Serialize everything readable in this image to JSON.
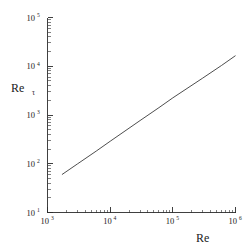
{
  "chart_data": {
    "type": "line",
    "title": "",
    "subtitle": "",
    "xlabel": "Re",
    "ylabel": "Re",
    "ylabel_subscript": "τ",
    "xscale": "log",
    "yscale": "log",
    "xlim": [
      1000,
      1000000
    ],
    "ylim": [
      10,
      100000
    ],
    "grid": false,
    "legend": null,
    "annotations": [],
    "x_tick_labels": [
      {
        "mantissa": "10",
        "exponent": "3",
        "value": 1000
      },
      {
        "mantissa": "10",
        "exponent": "4",
        "value": 10000
      },
      {
        "mantissa": "10",
        "exponent": "5",
        "value": 100000
      },
      {
        "mantissa": "10",
        "exponent": "6",
        "value": 1000000
      }
    ],
    "y_tick_labels": [
      {
        "mantissa": "10",
        "exponent": "1",
        "value": 10
      },
      {
        "mantissa": "10",
        "exponent": "2",
        "value": 100
      },
      {
        "mantissa": "10",
        "exponent": "3",
        "value": 1000
      },
      {
        "mantissa": "10",
        "exponent": "4",
        "value": 10000
      },
      {
        "mantissa": "10",
        "exponent": "5",
        "value": 100000
      }
    ],
    "series": [
      {
        "name": "Re_tau vs Re",
        "style": "solid",
        "color": "#3a3a3a",
        "x": [
          1700,
          3000,
          6000,
          10000,
          30000,
          60000,
          100000,
          300000,
          600000,
          1000000
        ],
        "y": [
          60,
          99,
          182,
          289,
          769,
          1415,
          2250,
          5720,
          10400,
          16500
        ]
      }
    ]
  },
  "figure": {
    "background_color": "#ffffff",
    "axis_color": "#2b2b2b",
    "line_color": "#3a3a3a"
  }
}
